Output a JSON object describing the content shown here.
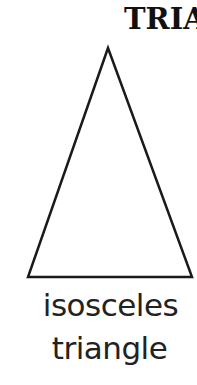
{
  "header": {
    "title": "TRIA"
  },
  "figure": {
    "shape": "isosceles-triangle",
    "stroke_color": "#1a1a1a",
    "vertices": {
      "apex": [
        108,
        48
      ],
      "bottom_left": [
        28,
        277
      ],
      "bottom_right": [
        192,
        277
      ]
    }
  },
  "caption": {
    "line1": "isosceles",
    "line2": "triangle"
  }
}
